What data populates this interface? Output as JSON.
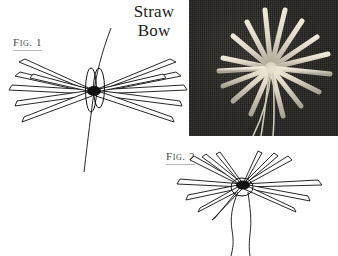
{
  "page": {
    "background_color": "#ffffff",
    "width": 338,
    "height": 256
  },
  "title": {
    "line1": "Straw",
    "line2": "Bow",
    "color": "#1c1c1c"
  },
  "figures": [
    {
      "id": "fig1",
      "label": "Fig. 1",
      "description": "Line drawing of straws splayed horizontally into a bow-tie fan, bound at the centre by a thread loop, with a long vertical thread passing through the knot.",
      "straw_count": 12,
      "ink_color": "#111111"
    },
    {
      "id": "fig2",
      "label": "Fig. 2",
      "description": "Line drawing of straws fanned radially outward from the central knot, with two thread tails hanging down below.",
      "straw_count": 13,
      "ink_color": "#111111"
    }
  ],
  "photo": {
    "caption_alt": "Photograph of pale straws arranged in a radial starburst on dark textured fabric with thread ends trailing downward",
    "background_color": "#262521",
    "straw_color": "#d9d4c4",
    "straw_count": 14
  }
}
